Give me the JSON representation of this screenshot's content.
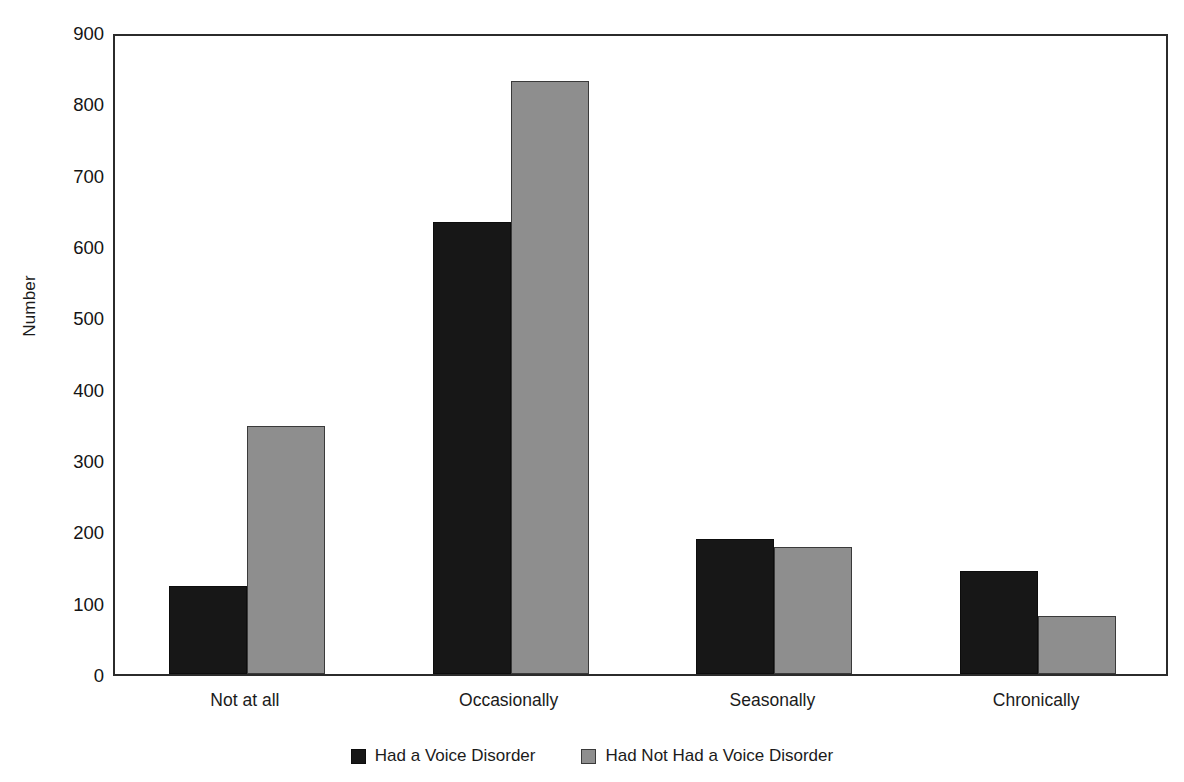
{
  "chart_data": {
    "type": "bar",
    "title": "",
    "xlabel": "",
    "ylabel": "Number",
    "categories": [
      "Not at all",
      "Occasionally",
      "Seasonally",
      "Chronically"
    ],
    "series": [
      {
        "name": "Had a Voice Disorder",
        "color": "#171717",
        "values": [
          123,
          633,
          189,
          145
        ]
      },
      {
        "name": "Had Not Had a Voice Disorder",
        "color": "#8e8e8e",
        "values": [
          348,
          831,
          178,
          82
        ]
      }
    ],
    "ylim": [
      0,
      900
    ],
    "ytick_step": 100,
    "yticks": [
      "0",
      "100",
      "200",
      "300",
      "400",
      "500",
      "600",
      "700",
      "800",
      "900"
    ],
    "grid": false,
    "legend_position": "bottom-center",
    "frame": true
  },
  "legend": {
    "items": [
      {
        "label": "Had a Voice Disorder",
        "swatch": "dark-swatch"
      },
      {
        "label": "Had Not Had a Voice Disorder",
        "swatch": "gray-swatch"
      }
    ]
  },
  "axes": {
    "y_title": "Number"
  }
}
